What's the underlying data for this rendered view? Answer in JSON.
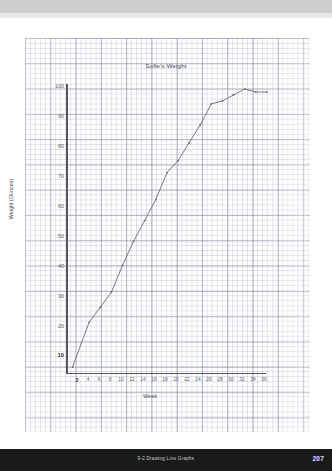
{
  "page": {
    "footer_label": "9-2  Drawing Line Graphs",
    "page_number": "207"
  },
  "chart_data": {
    "type": "line",
    "title": "Sofie's Weight",
    "xlabel": "Week",
    "ylabel": "Weight (Ounces)",
    "xlim": [
      0,
      37
    ],
    "ylim": [
      0,
      104
    ],
    "grid": true,
    "legend": "none",
    "x_ticks": [
      "2",
      "4",
      "6",
      "8",
      "10",
      "12",
      "14",
      "16",
      "18",
      "20",
      "22",
      "24",
      "26",
      "28",
      "30",
      "32",
      "34",
      "36"
    ],
    "y_ticks": [
      "10",
      "20",
      "30",
      "40",
      "50",
      "60",
      "70",
      "80",
      "90",
      "100"
    ],
    "emphasized_ticks": {
      "x": "2",
      "y": "10"
    },
    "series": [
      {
        "name": "Sofie's weight",
        "x": [
          1,
          4,
          6,
          8,
          10,
          12,
          14,
          16,
          18,
          20,
          22,
          24,
          26,
          28,
          30,
          32,
          34,
          36
        ],
        "values": [
          6,
          21,
          26,
          31,
          40,
          48,
          55,
          62,
          71,
          75,
          81,
          87,
          94,
          95,
          97,
          99,
          98,
          98
        ]
      }
    ]
  }
}
